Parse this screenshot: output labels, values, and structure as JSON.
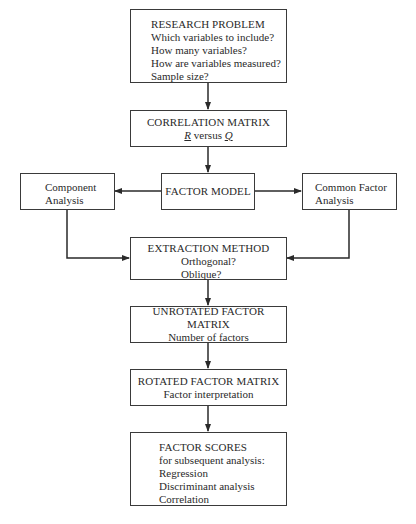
{
  "diagram": {
    "type": "flowchart",
    "nodes": {
      "research_problem": {
        "title": "RESEARCH PROBLEM",
        "lines": [
          "Which variables to include?",
          "How many variables?",
          "How are variables measured?",
          "Sample size?"
        ]
      },
      "correlation_matrix": {
        "title": "CORRELATION MATRIX",
        "sub_r": "R",
        "sub_versus": " versus ",
        "sub_q": "Q"
      },
      "factor_model": {
        "title": "FACTOR MODEL"
      },
      "component_analysis": {
        "lines": [
          "Component",
          "Analysis"
        ]
      },
      "common_factor_analysis": {
        "lines": [
          "Common Factor",
          "Analysis"
        ]
      },
      "extraction_method": {
        "title": "EXTRACTION METHOD",
        "lines": [
          "Orthogonal?",
          "Oblique?"
        ]
      },
      "unrotated_factor_matrix": {
        "title": "UNROTATED FACTOR MATRIX",
        "lines": [
          "Number of factors"
        ]
      },
      "rotated_factor_matrix": {
        "title": "ROTATED FACTOR MATRIX",
        "lines": [
          "Factor interpretation"
        ]
      },
      "factor_scores": {
        "title": "FACTOR SCORES",
        "lines": [
          "for subsequent analysis:",
          "Regression",
          "Discriminant analysis",
          "Correlation"
        ]
      }
    },
    "edges": [
      [
        "research_problem",
        "correlation_matrix"
      ],
      [
        "correlation_matrix",
        "factor_model"
      ],
      [
        "factor_model",
        "component_analysis"
      ],
      [
        "factor_model",
        "common_factor_analysis"
      ],
      [
        "component_analysis",
        "extraction_method"
      ],
      [
        "common_factor_analysis",
        "extraction_method"
      ],
      [
        "extraction_method",
        "unrotated_factor_matrix"
      ],
      [
        "unrotated_factor_matrix",
        "rotated_factor_matrix"
      ],
      [
        "rotated_factor_matrix",
        "factor_scores"
      ]
    ],
    "line_color": "#2a2a2a"
  }
}
